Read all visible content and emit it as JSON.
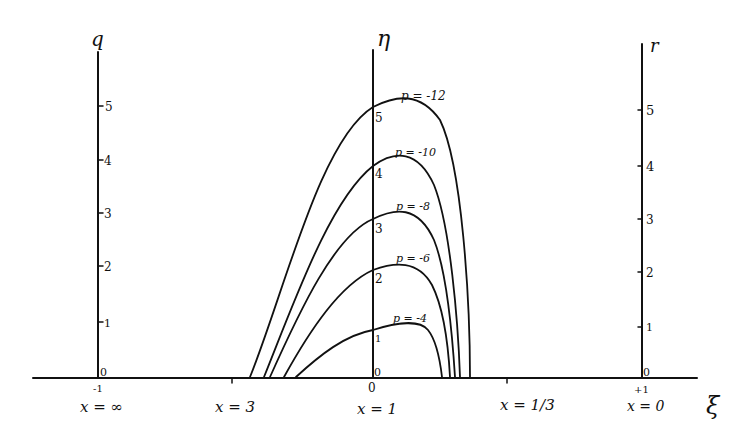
{
  "diagram": {
    "type": "hand-drawn curve family plot",
    "ink_color": "#111111",
    "background": "#ffffff",
    "axes": {
      "horizontal": {
        "label": "ξ",
        "ticks": [
          {
            "top": "-1",
            "bottom": "x = ∞"
          },
          {
            "top": "",
            "bottom": "x = 3"
          },
          {
            "top": "0",
            "bottom": "x = 1"
          },
          {
            "top": "",
            "bottom": "x = 1/3"
          },
          {
            "top": "+1",
            "bottom": "x = 0"
          }
        ]
      },
      "left": {
        "label": "q",
        "ticks": [
          "0",
          "1",
          "2",
          "3",
          "4",
          "5"
        ]
      },
      "center": {
        "label": "η",
        "ticks": [
          "0",
          "1",
          "2",
          "3",
          "4",
          "5"
        ]
      },
      "right": {
        "label": "r",
        "ticks": [
          "0",
          "1",
          "2",
          "3",
          "4",
          "5"
        ]
      }
    },
    "curves": [
      {
        "label": "p = -4",
        "peak": 1
      },
      {
        "label": "p = -6",
        "peak": 2
      },
      {
        "label": "p = -8",
        "peak": 3
      },
      {
        "label": "p = -10",
        "peak": 4
      },
      {
        "label": "p = -12",
        "peak": 5
      }
    ]
  }
}
